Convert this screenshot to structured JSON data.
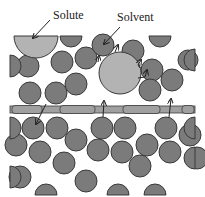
{
  "labels": {
    "solute": "Solute",
    "solvent": "Solvent"
  },
  "colors": {
    "solvent_particle": "#7b7b7b",
    "solute_particle": "#b3b3b3",
    "membrane": "#a0a0a0",
    "outline": "#3a3a3a",
    "background": "#ffffff"
  },
  "dark_circles": [
    [
      28,
      66,
      11
    ],
    [
      62,
      62,
      11
    ],
    [
      86,
      58,
      11
    ],
    [
      103,
      45,
      11
    ],
    [
      133,
      51,
      11
    ],
    [
      152,
      70,
      11
    ],
    [
      172,
      80,
      11
    ],
    [
      30,
      93,
      11
    ],
    [
      56,
      93,
      11
    ],
    [
      76,
      84,
      11
    ],
    [
      150,
      90,
      11
    ],
    [
      188,
      60,
      10
    ],
    [
      33,
      128,
      11
    ],
    [
      57,
      128,
      11
    ],
    [
      76,
      140,
      11
    ],
    [
      102,
      128,
      11
    ],
    [
      125,
      128,
      11
    ],
    [
      166,
      128,
      11
    ],
    [
      190,
      135,
      11
    ],
    [
      16,
      145,
      11
    ],
    [
      40,
      152,
      11
    ],
    [
      64,
      163,
      11
    ],
    [
      98,
      150,
      11
    ],
    [
      122,
      152,
      11
    ],
    [
      147,
      145,
      11
    ],
    [
      170,
      152,
      11
    ],
    [
      197,
      158,
      11
    ],
    [
      20,
      177,
      11
    ],
    [
      86,
      181,
      11
    ],
    [
      140,
      166,
      11
    ]
  ],
  "half_circles_top": [
    [
      71,
      36,
      11
    ],
    [
      160,
      36,
      11
    ]
  ],
  "half_circles_bottom": [
    [
      46,
      197,
      11
    ],
    [
      118,
      197,
      11
    ],
    [
      155,
      197,
      11
    ]
  ],
  "solute_half": [
    36,
    36,
    22
  ],
  "solute_circle": [
    120,
    73,
    21
  ],
  "membrane": {
    "x": 10,
    "y": 106,
    "w": 185,
    "h": 7
  }
}
